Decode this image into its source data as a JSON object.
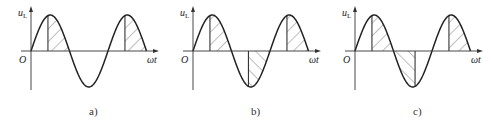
{
  "figure": {
    "panels": [
      {
        "id": "a",
        "caption": "a)",
        "origin_x": 31,
        "y_label": "u",
        "y_sub": "L",
        "x_label": "ωt",
        "origin_label": "O",
        "shaded": "positive half-cycles only, from firing angle to end of positive half",
        "shaded_regions": [
          [
            0.22,
            0.5
          ],
          [
            1.22,
            1.5
          ]
        ]
      },
      {
        "id": "b",
        "caption": "b)",
        "origin_x": 193,
        "y_label": "u",
        "y_sub": "L",
        "x_label": "ωt",
        "origin_label": "O",
        "shaded": "positive and negative half-cycles, each from firing angle to end of half-cycle",
        "shaded_regions": [
          [
            0.22,
            0.5
          ],
          [
            0.72,
            1.0
          ],
          [
            1.22,
            1.5
          ]
        ]
      },
      {
        "id": "c",
        "caption": "c)",
        "origin_x": 355,
        "y_label": "u",
        "y_sub": "L",
        "x_label": "ωt",
        "origin_label": "O",
        "shaded": "positive half-cycle from firing angle plus negative half-cycle start portion",
        "shaded_regions": [
          [
            0.22,
            0.5
          ],
          [
            0.5,
            0.78
          ],
          [
            1.22,
            1.5
          ]
        ]
      }
    ],
    "geometry": {
      "axis_y": 51,
      "amplitude": 36,
      "period_px": 77,
      "x_axis_len": 122,
      "y_axis_top": 8,
      "y_axis_bottom": 90,
      "caption_y": 115
    }
  }
}
